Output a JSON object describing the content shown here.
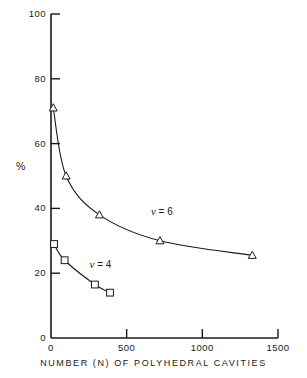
{
  "chart_data": {
    "type": "line",
    "title": "",
    "xlabel": "NUMBER (N) OF POLYHEDRAL CAVITIES",
    "ylabel": "%",
    "xlim": [
      0,
      1500
    ],
    "ylim": [
      0,
      100
    ],
    "grid": false,
    "legend_position": "inline-annotation",
    "xticks": [
      {
        "value": 0,
        "label": "0"
      },
      {
        "value": 500,
        "label": "500"
      },
      {
        "value": 1000,
        "label": "1000"
      },
      {
        "value": 1500,
        "label": "1500"
      }
    ],
    "yticks": [
      {
        "value": 0,
        "label": "0"
      },
      {
        "value": 20,
        "label": "20"
      },
      {
        "value": 40,
        "label": "40"
      },
      {
        "value": 60,
        "label": "60"
      },
      {
        "value": 80,
        "label": "80"
      },
      {
        "value": 100,
        "label": "100"
      }
    ],
    "series": [
      {
        "name": "nu = 6",
        "annotation": "= 6",
        "symbol": "nu",
        "marker": "triangle-up",
        "annotation_x": 660,
        "annotation_y": 39,
        "points": [
          {
            "x": 15,
            "y": 71
          },
          {
            "x": 100,
            "y": 50
          },
          {
            "x": 320,
            "y": 38
          },
          {
            "x": 720,
            "y": 30
          },
          {
            "x": 1330,
            "y": 25.5
          }
        ]
      },
      {
        "name": "nu = 4",
        "annotation": "= 4",
        "symbol": "nu",
        "marker": "square",
        "annotation_x": 255,
        "annotation_y": 22.5,
        "points": [
          {
            "x": 20,
            "y": 29
          },
          {
            "x": 90,
            "y": 24
          },
          {
            "x": 290,
            "y": 16.5
          },
          {
            "x": 390,
            "y": 14
          }
        ]
      }
    ],
    "colors": {
      "axis": "#1a1a1a",
      "line": "#1a1a1a",
      "marker_fill": "#ffffff",
      "background": "#ffffff"
    }
  }
}
